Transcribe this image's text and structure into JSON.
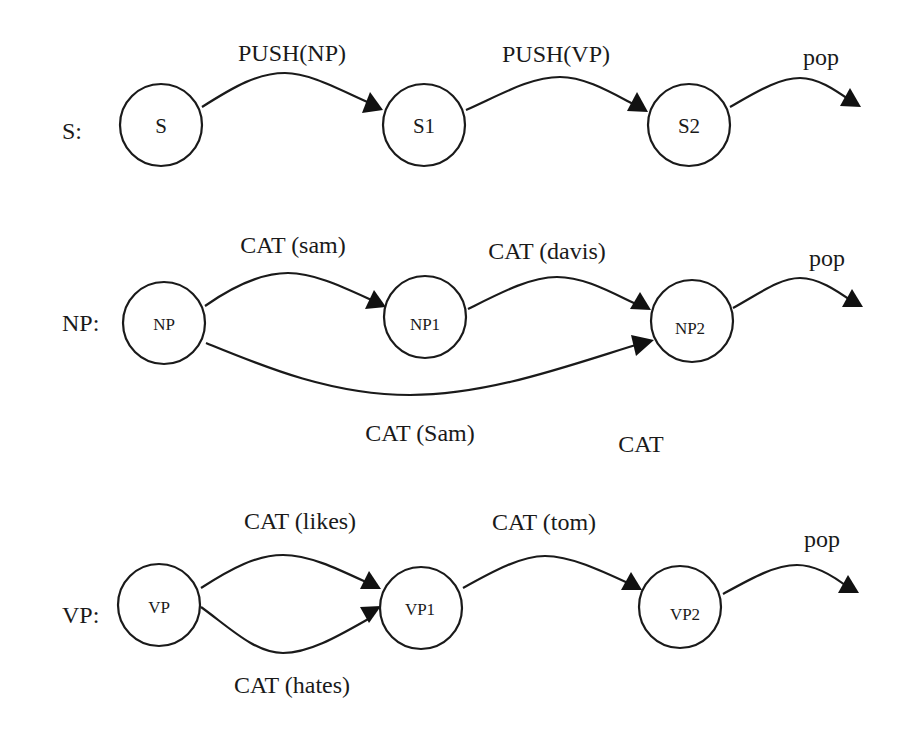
{
  "diagram": {
    "type": "augmented transition network",
    "networks": [
      {
        "label": "S:",
        "nodes": [
          "S",
          "S1",
          "S2"
        ],
        "arcs": [
          {
            "from": "S",
            "to": "S1",
            "label": "PUSH(NP)"
          },
          {
            "from": "S1",
            "to": "S2",
            "label": "PUSH(VP)"
          },
          {
            "from": "S2",
            "to": null,
            "label": "pop"
          }
        ]
      },
      {
        "label": "NP:",
        "nodes": [
          "NP",
          "NP1",
          "NP2"
        ],
        "arcs": [
          {
            "from": "NP",
            "to": "NP1",
            "label": "CAT (sam)"
          },
          {
            "from": "NP1",
            "to": "NP2",
            "label": "CAT (davis)"
          },
          {
            "from": "NP2",
            "to": null,
            "label": "pop"
          },
          {
            "from": "NP",
            "to": "NP2",
            "label": "CAT (Sam)"
          }
        ],
        "extra_text": "CAT"
      },
      {
        "label": "VP:",
        "nodes": [
          "VP",
          "VP1",
          "VP2"
        ],
        "arcs": [
          {
            "from": "VP",
            "to": "VP1",
            "label": "CAT (likes)"
          },
          {
            "from": "VP",
            "to": "VP1",
            "label": "CAT (hates)"
          },
          {
            "from": "VP1",
            "to": "VP2",
            "label": "CAT (tom)"
          },
          {
            "from": "VP2",
            "to": null,
            "label": "pop"
          }
        ]
      }
    ]
  },
  "colors": {
    "stroke": "#1a1a1a",
    "background": "#ffffff"
  }
}
